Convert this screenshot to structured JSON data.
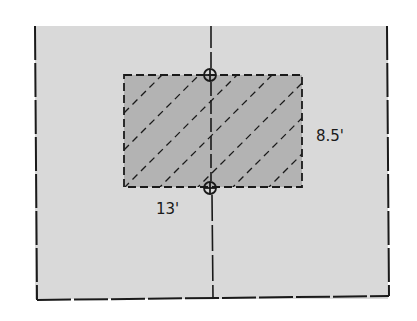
{
  "diagram": {
    "type": "site-plan",
    "colors": {
      "background": "#ffffff",
      "lot_fill": "#d9d9d9",
      "footprint_fill": "#b3b3b3",
      "line": "#1a1a1a"
    },
    "lot": {
      "left": 34,
      "right": 389,
      "top": 26,
      "bottom": 300
    },
    "center_line": {
      "x": 212
    },
    "footprint": {
      "x": 124,
      "y": 75,
      "width": 178,
      "height": 112,
      "hatch": "dashed-diagonal"
    },
    "markers": [
      {
        "name": "top-marker",
        "cx": 210,
        "cy": 75
      },
      {
        "name": "bottom-marker",
        "cx": 210,
        "cy": 188
      }
    ],
    "dimensions": {
      "width_label": "13'",
      "height_label": "8.5'"
    }
  }
}
